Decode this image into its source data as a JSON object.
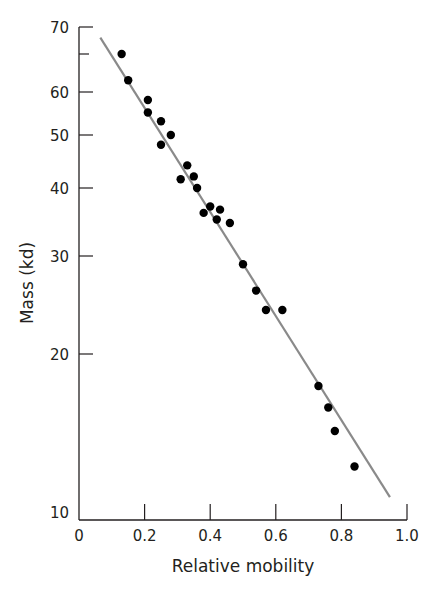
{
  "chart_data": {
    "type": "scatter",
    "title": "",
    "xlabel": "Relative mobility",
    "ylabel": "Mass (kd)",
    "xlim": [
      0,
      1.0
    ],
    "ylim": [
      10,
      70
    ],
    "yscale": "log",
    "grid": false,
    "legend": null,
    "x_ticks": [
      {
        "value": 0,
        "label": "0"
      },
      {
        "value": 0.2,
        "label": "0.2"
      },
      {
        "value": 0.4,
        "label": "0.4"
      },
      {
        "value": 0.6,
        "label": "0.6"
      },
      {
        "value": 0.8,
        "label": "0.8"
      },
      {
        "value": 1.0,
        "label": "1.0"
      }
    ],
    "y_ticks": [
      {
        "value": 10,
        "label": "10"
      },
      {
        "value": 20,
        "label": "20"
      },
      {
        "value": 30,
        "label": "30"
      },
      {
        "value": 40,
        "label": "40"
      },
      {
        "value": 50,
        "label": "50"
      },
      {
        "value": 60,
        "label": "60"
      },
      {
        "value": 65,
        "label": ""
      },
      {
        "value": 70,
        "label": "70"
      }
    ],
    "series": [
      {
        "name": "Protein standards",
        "type": "scatter",
        "color": "#000000",
        "points": [
          {
            "x": 0.13,
            "y": 65
          },
          {
            "x": 0.15,
            "y": 61.5
          },
          {
            "x": 0.21,
            "y": 58
          },
          {
            "x": 0.21,
            "y": 55
          },
          {
            "x": 0.25,
            "y": 53
          },
          {
            "x": 0.28,
            "y": 50
          },
          {
            "x": 0.25,
            "y": 48
          },
          {
            "x": 0.33,
            "y": 44
          },
          {
            "x": 0.31,
            "y": 41.5
          },
          {
            "x": 0.35,
            "y": 42
          },
          {
            "x": 0.36,
            "y": 40
          },
          {
            "x": 0.4,
            "y": 37
          },
          {
            "x": 0.38,
            "y": 36
          },
          {
            "x": 0.43,
            "y": 36.5
          },
          {
            "x": 0.42,
            "y": 35
          },
          {
            "x": 0.46,
            "y": 34.5
          },
          {
            "x": 0.5,
            "y": 29
          },
          {
            "x": 0.54,
            "y": 26
          },
          {
            "x": 0.57,
            "y": 24
          },
          {
            "x": 0.62,
            "y": 24
          },
          {
            "x": 0.73,
            "y": 17.5
          },
          {
            "x": 0.76,
            "y": 16
          },
          {
            "x": 0.78,
            "y": 14.5
          },
          {
            "x": 0.84,
            "y": 12.5
          }
        ]
      },
      {
        "name": "Fit line",
        "type": "line",
        "color": "#8a8a8a",
        "points": [
          {
            "x": 0.065,
            "y": 68
          },
          {
            "x": 0.948,
            "y": 11
          }
        ]
      }
    ]
  }
}
